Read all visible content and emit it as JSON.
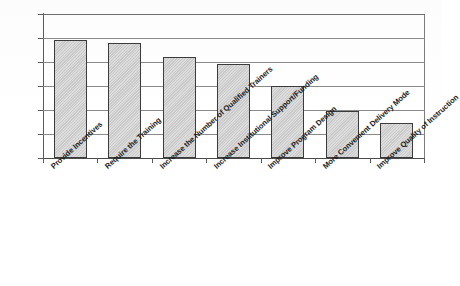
{
  "chart_data": {
    "type": "bar",
    "title": "",
    "subtitle": "",
    "xlabel": "",
    "ylabel": "",
    "ylim": [
      0,
      60
    ],
    "y_tick_step": 10,
    "grid": true,
    "legend": "none",
    "orientation": "vertical",
    "value_suffix": "%",
    "categories": [
      "Provide Incentives",
      "Require the Training",
      "Increase the Number of Qualified Trainers",
      "Increase Institutional Support/Funding",
      "Improve Program Design",
      "More Convenient Delivery Mode",
      "Improve Quality of Instruction"
    ],
    "values": [
      49,
      48,
      42,
      39,
      30,
      19.5,
      14.5
    ],
    "y_tick_labels": [
      "0%",
      "10%",
      "20%",
      "30%",
      "40%",
      "50%",
      "60%"
    ],
    "y_tick_values": [
      0,
      10,
      20,
      30,
      40,
      50,
      60
    ],
    "colors": {
      "bar_fill": "#cfcfcf",
      "bar_border": "#3b3b3b",
      "gridline": "#8a8a8a",
      "axis": "#5a5a5a",
      "text": "#1a1a1a",
      "background": "#ffffff"
    }
  },
  "axes": {
    "y": {
      "ticks": [
        {
          "label": "60%",
          "value": 60
        },
        {
          "label": "50%",
          "value": 50
        },
        {
          "label": "40%",
          "value": 40
        },
        {
          "label": "30%",
          "value": 30
        },
        {
          "label": "20%",
          "value": 20
        },
        {
          "label": "10%",
          "value": 10
        },
        {
          "label": "0%",
          "value": 0
        }
      ]
    },
    "x": {
      "ticks": [
        {
          "label": "Provide Incentives"
        },
        {
          "label": "Require the Training"
        },
        {
          "label": "Increase the Number of Qualified Trainers"
        },
        {
          "label": "Increase Institutional Support/Funding"
        },
        {
          "label": "Improve Program Design"
        },
        {
          "label": "More Convenient Delivery Mode"
        },
        {
          "label": "Improve Quality of Instruction"
        }
      ]
    }
  }
}
